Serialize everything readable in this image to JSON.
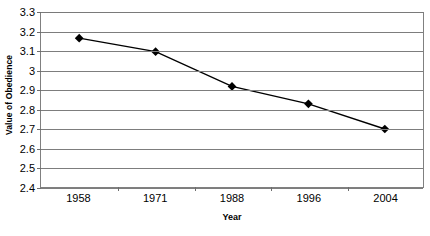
{
  "chart_data": {
    "type": "line",
    "title": "",
    "xlabel": "Year",
    "ylabel": "Value of Obedience",
    "categories": [
      "1958",
      "1971",
      "1988",
      "1996",
      "2004"
    ],
    "values": [
      3.17,
      3.1,
      2.92,
      2.83,
      2.7
    ],
    "series": [
      {
        "name": "Value of Obedience",
        "values": [
          3.17,
          3.1,
          2.92,
          2.83,
          2.7
        ]
      }
    ],
    "ylim": [
      2.4,
      3.3
    ],
    "ytick_labels": [
      "3.3",
      "3.2",
      "3.1",
      "3",
      "2.9",
      "2.8",
      "2.7",
      "2.6",
      "2.5",
      "2.4"
    ],
    "ytick_values": [
      3.3,
      3.2,
      3.1,
      3.0,
      2.9,
      2.8,
      2.7,
      2.6,
      2.5,
      2.4
    ],
    "grid": true,
    "legend": false,
    "legend_position": "none",
    "marker": "diamond",
    "series_color": "#000000",
    "gridline_color": "#7d7d7d",
    "plot_border_color": "#808080",
    "background_color": "#ffffff"
  }
}
